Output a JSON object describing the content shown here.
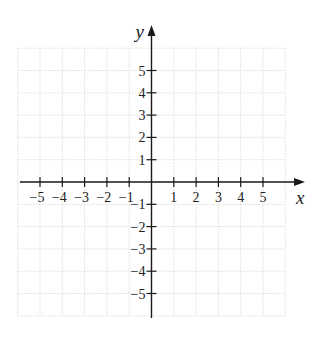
{
  "chart_data": {
    "type": "scatter",
    "title": "",
    "xlabel": "x",
    "ylabel": "y",
    "xlim": [
      -6,
      6
    ],
    "ylim": [
      -6,
      6
    ],
    "grid": true,
    "x_ticks": [
      -5,
      -4,
      -3,
      -2,
      -1,
      1,
      2,
      3,
      4,
      5
    ],
    "y_ticks": [
      -5,
      -4,
      -3,
      -2,
      -1,
      1,
      2,
      3,
      4,
      5
    ],
    "x_tick_labels": [
      "−5",
      "−4",
      "−3",
      "−2",
      "−1",
      "1",
      "2",
      "3",
      "4",
      "5"
    ],
    "y_tick_labels": [
      "−5",
      "−4",
      "−3",
      "−2",
      "−1",
      "1",
      "2",
      "3",
      "4",
      "5"
    ],
    "series": []
  },
  "colors": {
    "axis": "#1a1a1a",
    "grid": "#e4e4e4",
    "background": "#ffffff"
  },
  "layout": {
    "origin_x": 151.5,
    "origin_y": 182,
    "unit": 22.3,
    "x_axis_start": 20,
    "x_axis_end": 305,
    "y_axis_top": 25,
    "y_axis_bottom": 318
  }
}
